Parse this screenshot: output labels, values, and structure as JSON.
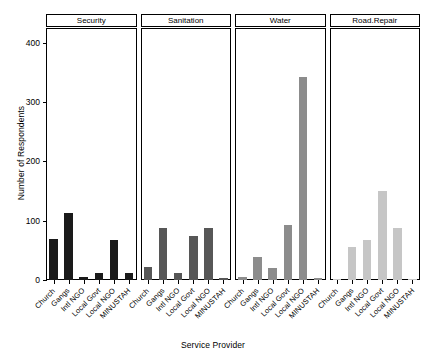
{
  "chart_data": {
    "type": "bar",
    "title": "",
    "subtitle": "",
    "xlabel": "Service Provider",
    "ylabel": "Number of Respondents",
    "ylim": [
      0,
      425
    ],
    "yticks": [
      0,
      100,
      200,
      300,
      400
    ],
    "ytick_labels": [
      "0",
      "100",
      "200",
      "300",
      "400"
    ],
    "grid": false,
    "legend": "none",
    "layout": "faceted-panels-horizontal",
    "categories": [
      "Church",
      "Gangs",
      "Intl NGO",
      "Local Govt",
      "Local NGO",
      "MINUSTAH"
    ],
    "panels": [
      {
        "name": "Security",
        "color": "#1a1a1a",
        "values": [
          70,
          113,
          5,
          12,
          68,
          11
        ]
      },
      {
        "name": "Sanitation",
        "color": "#575757",
        "values": [
          22,
          88,
          12,
          75,
          88,
          3
        ]
      },
      {
        "name": "Water",
        "color": "#8c8c8c",
        "values": [
          5,
          38,
          20,
          93,
          343,
          3
        ]
      },
      {
        "name": "Road.Repair",
        "color": "#c6c6c6",
        "values": [
          2,
          55,
          67,
          150,
          88,
          0
        ]
      }
    ],
    "series": [
      {
        "name": "Security",
        "values": [
          70,
          113,
          5,
          12,
          68,
          11
        ]
      },
      {
        "name": "Sanitation",
        "values": [
          22,
          88,
          12,
          75,
          88,
          3
        ]
      },
      {
        "name": "Water",
        "values": [
          5,
          38,
          20,
          93,
          343,
          3
        ]
      },
      {
        "name": "Road.Repair",
        "values": [
          2,
          55,
          67,
          150,
          88,
          0
        ]
      }
    ]
  }
}
